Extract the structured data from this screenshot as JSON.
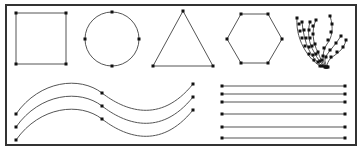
{
  "figure": {
    "frame": {
      "x": 6,
      "y": 5,
      "width": 350,
      "height": 140,
      "stroke": "#333333",
      "stroke_width": 2
    },
    "stroke_color": "#555555",
    "point_color": "#111111",
    "point_radius": 1.5,
    "top_row": {
      "square": {
        "points": [
          [
            16,
            13
          ],
          [
            66,
            13
          ],
          [
            66,
            64
          ],
          [
            16,
            64
          ]
        ]
      },
      "circle": {
        "cx": 112,
        "cy": 39,
        "r": 27,
        "points": [
          [
            112,
            12
          ],
          [
            139,
            39
          ],
          [
            112,
            66
          ],
          [
            85,
            39
          ]
        ]
      },
      "triangle": {
        "points": [
          [
            183,
            11
          ],
          [
            213,
            66
          ],
          [
            153,
            66
          ]
        ]
      },
      "hexagon": {
        "points": [
          [
            241,
            14
          ],
          [
            268,
            14
          ],
          [
            282,
            39
          ],
          [
            268,
            63
          ],
          [
            241,
            63
          ],
          [
            227,
            39
          ]
        ]
      },
      "fan_strokes": {
        "root": [
          326,
          67
        ],
        "strands": [
          {
            "path": "M297,18 C296,30 300,42 305,50 C309,57 314,62 320,66",
            "points": [
              [
                297,
                18
              ],
              [
                299,
                24
              ],
              [
                300,
                31
              ],
              [
                302,
                38
              ],
              [
                305,
                46
              ],
              [
                309,
                54
              ],
              [
                314,
                60
              ],
              [
                320,
                66
              ]
            ]
          },
          {
            "path": "M302,22 C303,32 305,42 309,50 C312,57 317,62 322,66",
            "points": [
              [
                302,
                22
              ],
              [
                304,
                30
              ],
              [
                306,
                38
              ],
              [
                309,
                47
              ],
              [
                313,
                55
              ],
              [
                318,
                62
              ],
              [
                322,
                66
              ]
            ]
          },
          {
            "path": "M310,22 C307,32 309,44 314,52 C317,58 320,62 324,66",
            "points": [
              [
                310,
                22
              ],
              [
                309,
                30
              ],
              [
                310,
                38
              ],
              [
                312,
                46
              ],
              [
                316,
                54
              ],
              [
                320,
                61
              ],
              [
                324,
                66
              ]
            ]
          },
          {
            "path": "M316,20 C311,30 313,44 318,52 C320,58 322,62 325,67",
            "points": [
              [
                316,
                20
              ],
              [
                313,
                26
              ],
              [
                313,
                34
              ],
              [
                315,
                44
              ],
              [
                318,
                52
              ],
              [
                322,
                60
              ],
              [
                325,
                67
              ]
            ]
          },
          {
            "path": "M330,16 C334,28 332,38 327,44 C322,52 322,60 326,67",
            "points": [
              [
                330,
                16
              ],
              [
                332,
                24
              ],
              [
                331,
                32
              ],
              [
                328,
                40
              ],
              [
                324,
                48
              ],
              [
                323,
                56
              ],
              [
                326,
                67
              ]
            ]
          },
          {
            "path": "M346,40 C344,50 336,54 331,58 C328,61 327,64 327,67",
            "points": [
              [
                346,
                40
              ],
              [
                343,
                47
              ],
              [
                337,
                52
              ],
              [
                331,
                57
              ],
              [
                327,
                67
              ]
            ]
          },
          {
            "path": "M341,36 C336,44 330,50 326,56 C324,60 325,64 328,67",
            "points": [
              [
                341,
                36
              ],
              [
                336,
                43
              ],
              [
                330,
                50
              ],
              [
                326,
                57
              ],
              [
                328,
                67
              ]
            ]
          }
        ]
      }
    },
    "bottom_row": {
      "waves": [
        {
          "path": "M16,114 C40,80 80,76 102,93 C124,110 160,125 193,84",
          "points": [
            [
              16,
              114
            ],
            [
              102,
              93
            ],
            [
              193,
              84
            ]
          ]
        },
        {
          "path": "M16,127 C40,93 80,89 102,106 C124,123 160,138 193,97",
          "points": [
            [
              16,
              127
            ],
            [
              102,
              106
            ],
            [
              193,
              97
            ]
          ]
        },
        {
          "path": "M16,140 C40,106 80,102 102,119 C124,136 160,151 193,110",
          "points": [
            [
              16,
              140
            ],
            [
              102,
              119
            ],
            [
              193,
              110
            ]
          ]
        }
      ],
      "lines": [
        {
          "x1": 222,
          "x2": 345,
          "y": 86
        },
        {
          "x1": 222,
          "x2": 345,
          "y": 94
        },
        {
          "x1": 222,
          "x2": 345,
          "y": 102
        },
        {
          "x1": 222,
          "x2": 345,
          "y": 114
        },
        {
          "x1": 222,
          "x2": 345,
          "y": 127
        },
        {
          "x1": 222,
          "x2": 345,
          "y": 138
        }
      ]
    }
  }
}
